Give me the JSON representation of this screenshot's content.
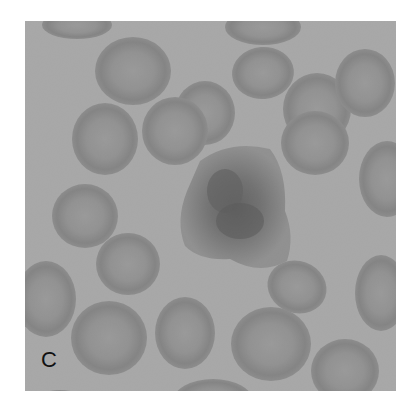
{
  "figure": {
    "panel_label": "C",
    "colors": {
      "background": "#a9a9a9",
      "rbc_rim": "#7e7e7e",
      "rbc_center": "#939393",
      "central_cell": "#6a6a6a",
      "nucleus": "#4a4a4a",
      "page": "#ffffff"
    }
  }
}
